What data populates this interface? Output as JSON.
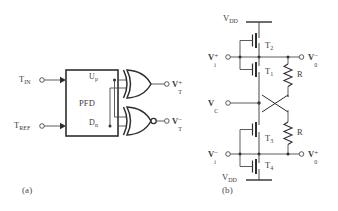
{
  "figure": {
    "background": "#ffffff",
    "line_color": "#4a4a4a",
    "text_color": "#3c3c3c"
  },
  "panel_a": {
    "tag": "(a)",
    "block": {
      "label": "PFD"
    },
    "inputs": [
      {
        "name": "t-in",
        "base": "T",
        "sub": "IN"
      },
      {
        "name": "t-ref",
        "base": "T",
        "sub": "REF"
      }
    ],
    "block_outputs": [
      {
        "name": "up",
        "base": "U",
        "sub": "p"
      },
      {
        "name": "dn",
        "base": "D",
        "sub": "n"
      }
    ],
    "gates": [
      {
        "name": "xor-gate",
        "type": "XOR",
        "bubble": false
      },
      {
        "name": "xnor-gate",
        "type": "XNOR",
        "bubble": true
      }
    ],
    "outputs": [
      {
        "name": "vt-plus",
        "base": "V",
        "sup": "+",
        "sub": "T"
      },
      {
        "name": "vt-minus",
        "base": "V",
        "sup": "−",
        "sub": "T"
      }
    ]
  },
  "panel_b": {
    "tag": "(b)",
    "supplies": [
      {
        "name": "vdd-top",
        "base": "V",
        "sub": "DD"
      },
      {
        "name": "vdd-bottom",
        "base": "V",
        "sub": "DD"
      }
    ],
    "transistors": [
      {
        "name": "transistor-t2",
        "base": "T",
        "sub": "2"
      },
      {
        "name": "transistor-t1",
        "base": "T",
        "sub": "1"
      },
      {
        "name": "transistor-t3",
        "base": "T",
        "sub": "3"
      },
      {
        "name": "transistor-t4",
        "base": "T",
        "sub": "4"
      }
    ],
    "resistors": [
      {
        "name": "resistor-upper",
        "label": "R"
      },
      {
        "name": "resistor-lower",
        "label": "R"
      }
    ],
    "inputs": [
      {
        "name": "vi-plus",
        "base": "V",
        "sup": "+",
        "sub": "i"
      },
      {
        "name": "vc",
        "base": "V",
        "sub": "C"
      },
      {
        "name": "vi-minus",
        "base": "V",
        "sup": "−",
        "sub": "i"
      }
    ],
    "outputs": [
      {
        "name": "vo-minus",
        "base": "V",
        "sup": "−",
        "sub": "0"
      },
      {
        "name": "vo-plus",
        "base": "V",
        "sup": "+",
        "sub": "0"
      }
    ]
  }
}
